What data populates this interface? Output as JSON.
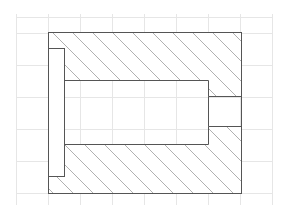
{
  "drawing": {
    "title": "Cross-section view with hatching",
    "grid": {
      "color": "#e6e6e6",
      "x": [
        16,
        48,
        80,
        112,
        144,
        176,
        208,
        240,
        272
      ],
      "y": [
        17,
        33,
        65,
        97,
        129,
        161,
        193
      ],
      "x_start": 16,
      "x_end": 272,
      "y_start": 14,
      "y_end": 205
    },
    "outline_color": "#555555",
    "hatch_color": "#b0b0b0",
    "outer": {
      "x": 48,
      "y": 32,
      "w": 193,
      "h": 161
    },
    "left_slot": {
      "x": 48,
      "y": 48,
      "w": 16,
      "h": 128
    },
    "bore": {
      "x": 64,
      "y": 80,
      "w": 144,
      "h": 64
    },
    "right_opening": {
      "x": 208,
      "y": 96,
      "w": 33,
      "h": 30
    },
    "hatch_spacing": 20
  }
}
